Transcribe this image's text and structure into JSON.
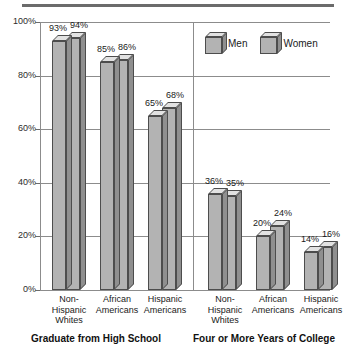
{
  "chart_data": {
    "type": "bar",
    "title": "",
    "xlabel": "",
    "ylabel": "",
    "ylim": [
      0,
      100
    ],
    "ytick_labels": [
      "100%",
      "80%",
      "60%",
      "40%",
      "20%",
      "0%"
    ],
    "ytick_values": [
      100,
      80,
      60,
      40,
      20,
      0
    ],
    "grid": true,
    "legend_position": "top-right",
    "categories": [
      "Non-Hispanic Whites",
      "African Americans",
      "Hispanic Americans",
      "Non-Hispanic Whites",
      "African Americans",
      "Hispanic Americans"
    ],
    "series": [
      {
        "name": "Men",
        "values": [
          93,
          85,
          65,
          36,
          20,
          14
        ],
        "value_labels": [
          "93%",
          "85%",
          "65%",
          "36%",
          "20%",
          "14%"
        ]
      },
      {
        "name": "Women",
        "values": [
          94,
          86,
          68,
          35,
          24,
          16
        ],
        "value_labels": [
          "94%",
          "86%",
          "68%",
          "35%",
          "24%",
          "16%"
        ]
      }
    ],
    "groups": [
      {
        "title": "Graduate from High School",
        "categories": [
          "Non-Hispanic Whites",
          "African Americans",
          "Hispanic Americans"
        ],
        "men": [
          93,
          85,
          65
        ],
        "women": [
          94,
          86,
          68
        ]
      },
      {
        "title": "Four or More Years of College",
        "categories": [
          "Non-Hispanic Whites",
          "African Americans",
          "Hispanic Americans"
        ],
        "men": [
          36,
          20,
          14
        ],
        "women": [
          35,
          24,
          16
        ]
      }
    ]
  },
  "axis": {
    "ticks": [
      {
        "label": "100%",
        "value": 100
      },
      {
        "label": "80%",
        "value": 80
      },
      {
        "label": "60%",
        "value": 60
      },
      {
        "label": "40%",
        "value": 40
      },
      {
        "label": "20%",
        "value": 20
      },
      {
        "label": "0%",
        "value": 0
      }
    ]
  },
  "legend": {
    "entries": [
      {
        "label": "Men"
      },
      {
        "label": "Women"
      }
    ]
  },
  "categories": [
    {
      "line1": "Non-",
      "line2": "Hispanic",
      "line3": "Whites"
    },
    {
      "line1": "African",
      "line2": "Americans",
      "line3": ""
    },
    {
      "line1": "Hispanic",
      "line2": "Americans",
      "line3": ""
    },
    {
      "line1": "Non-",
      "line2": "Hispanic",
      "line3": "Whites"
    },
    {
      "line1": "African",
      "line2": "Americans",
      "line3": ""
    },
    {
      "line1": "Hispanic",
      "line2": "Americans",
      "line3": ""
    }
  ],
  "group_titles": [
    "Graduate from High School",
    "Four or More Years of College"
  ],
  "bar_labels": {
    "g1": [
      "93%",
      "94%",
      "85%",
      "86%",
      "65%",
      "68%"
    ],
    "g2": [
      "36%",
      "35%",
      "20%",
      "24%",
      "14%",
      "16%"
    ]
  },
  "colors": {
    "bar_front": "#b3b3b3",
    "bar_top": "#e2e2e2",
    "bar_side": "#8f8f8f",
    "bar_outline": "#4d4d4d",
    "gridline": "#8c8c8c",
    "rule": "#6b6b6b",
    "text": "#1a1a1a"
  }
}
